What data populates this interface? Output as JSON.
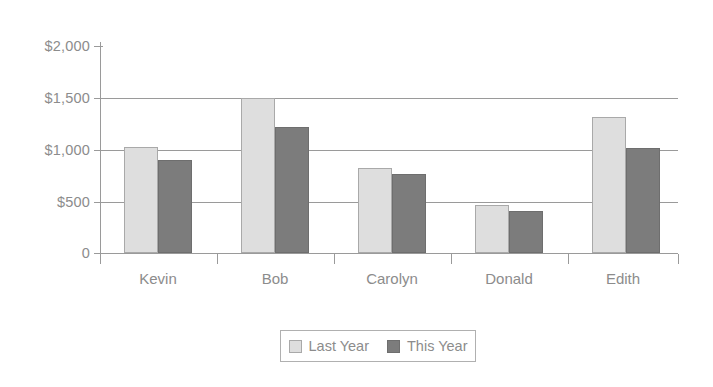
{
  "chart_data": {
    "type": "bar",
    "title": "",
    "xlabel": "",
    "ylabel": "",
    "categories": [
      "Kevin",
      "Bob",
      "Carolyn",
      "Donald",
      "Edith"
    ],
    "series": [
      {
        "name": "Last Year",
        "color": "#dedede",
        "values": [
          1020,
          1500,
          820,
          465,
          1310
        ]
      },
      {
        "name": "This Year",
        "color": "#7c7c7c",
        "values": [
          900,
          1220,
          760,
          410,
          1010
        ]
      }
    ],
    "ylim": [
      0,
      2000
    ],
    "yticks": [
      0,
      500,
      1000,
      1500,
      2000
    ],
    "ytick_labels": [
      "0",
      "$500",
      "$1,000",
      "$1,500",
      "$2,000"
    ],
    "grid": true,
    "legend_position": "bottom",
    "axis_color": "#9a9a9a",
    "text_color": "#8c8c8c",
    "background": "#ffffff"
  },
  "legend": {
    "items": [
      {
        "label": "Last Year",
        "swatch": "last"
      },
      {
        "label": "This Year",
        "swatch": "this"
      }
    ]
  }
}
